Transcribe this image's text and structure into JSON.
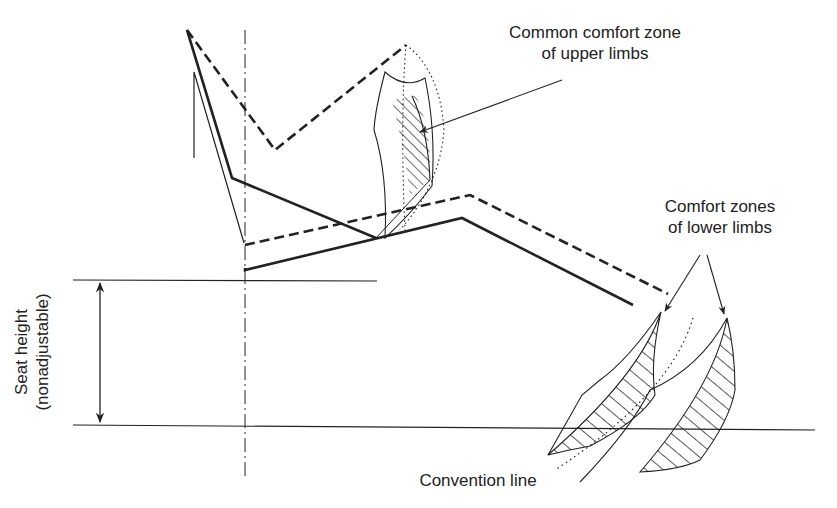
{
  "diagram": {
    "type": "ergonomic seating posture diagram",
    "labels": {
      "upper_zone_line1": "Common comfort zone",
      "upper_zone_line2": "of upper limbs",
      "lower_zone_line1": "Comfort zones",
      "lower_zone_line2": "of lower limbs",
      "seat_height_line1": "Seat height",
      "seat_height_line2": "(nonadjustable)",
      "convention_line": "Convention line"
    },
    "colors": {
      "stroke": "#222222",
      "background": "#ffffff"
    },
    "line_styles": {
      "posture_solid": "solid",
      "posture_alt": "dashed",
      "center_axis": "dash-dot",
      "convention": "dotted"
    }
  }
}
